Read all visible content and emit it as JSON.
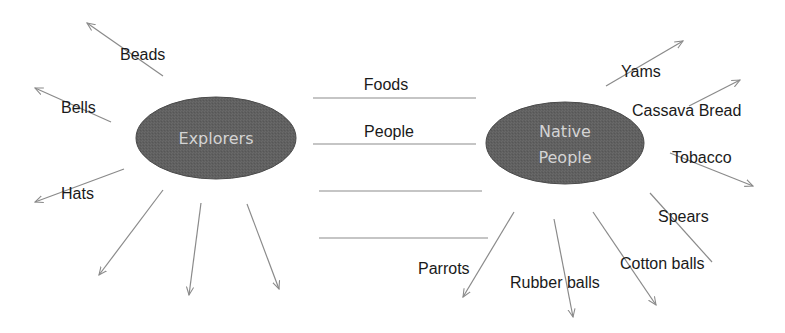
{
  "diagram": {
    "colors": {
      "node_fill": "#5f5f5f",
      "node_stroke": "#4a4a4a",
      "node_text": "#d4d4d4",
      "arrow": "#8a8a8a",
      "label": "#1a1a1a"
    },
    "nodes": {
      "explorers": {
        "label": "Explorers"
      },
      "native_people": {
        "line1": "Native",
        "line2": "People"
      }
    },
    "center_exchange": {
      "lines": [
        {
          "label": "Foods"
        },
        {
          "label": "People"
        },
        {
          "label": ""
        },
        {
          "label": ""
        }
      ]
    },
    "explorers_items": [
      {
        "label": "Beads"
      },
      {
        "label": "Bells"
      },
      {
        "label": "Hats"
      },
      {
        "label": ""
      },
      {
        "label": ""
      },
      {
        "label": ""
      }
    ],
    "native_items": [
      {
        "label": "Yams"
      },
      {
        "label": "Cassava Bread"
      },
      {
        "label": "Tobacco"
      },
      {
        "label": "Spears"
      },
      {
        "label": "Cotton balls"
      },
      {
        "label": "Rubber balls"
      },
      {
        "label": "Parrots"
      }
    ]
  }
}
